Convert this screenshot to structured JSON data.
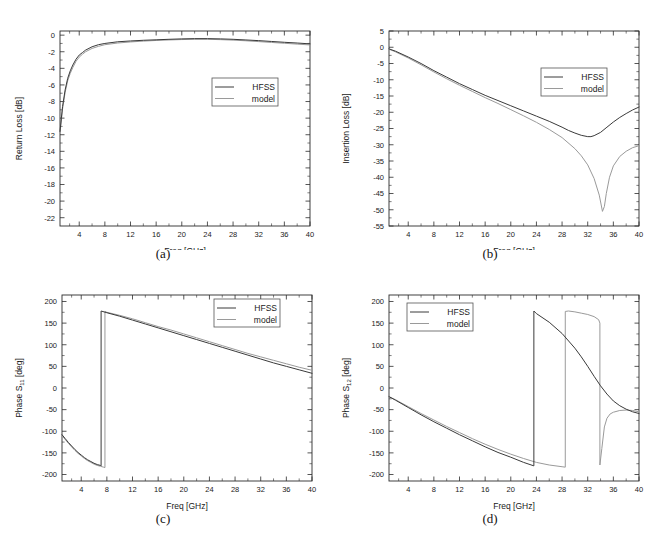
{
  "figure": {
    "panel_captions": [
      "(a)",
      "(b)",
      "(c)",
      "(d)"
    ],
    "legend_entries": [
      "HFSS",
      "model"
    ],
    "colors": {
      "hfss": "#3a3a3a",
      "model": "#9a9a9a",
      "axis": "#2b2b2b",
      "background": "#ffffff"
    }
  },
  "chart_data": [
    {
      "id": "a",
      "type": "line",
      "title": "",
      "caption": "(a)",
      "xlabel": "Freq [GHz]",
      "ylabel": "Return Loss [dB]",
      "xlim": [
        1,
        40
      ],
      "ylim": [
        -23,
        0.5
      ],
      "xticks": [
        4,
        8,
        12,
        16,
        20,
        24,
        28,
        32,
        36,
        40
      ],
      "yticks": [
        0,
        -2,
        -4,
        -6,
        -8,
        -10,
        -12,
        -14,
        -16,
        -18,
        -20,
        -22
      ],
      "grid": false,
      "legend": [
        "HFSS",
        "model"
      ],
      "legend_position": "center-right",
      "series": [
        {
          "name": "HFSS",
          "x": [
            1,
            1.4,
            1.8,
            2.2,
            2.6,
            3,
            3.5,
            4,
            4.5,
            5,
            6,
            7,
            8,
            10,
            12,
            14,
            16,
            18,
            20,
            22,
            24,
            26,
            28,
            30,
            32,
            34,
            36,
            38,
            40
          ],
          "y": [
            -11.6,
            -8.6,
            -6.6,
            -5.2,
            -4.3,
            -3.6,
            -2.9,
            -2.4,
            -2.1,
            -1.8,
            -1.4,
            -1.15,
            -1.0,
            -0.8,
            -0.7,
            -0.62,
            -0.56,
            -0.5,
            -0.45,
            -0.42,
            -0.42,
            -0.45,
            -0.5,
            -0.58,
            -0.66,
            -0.76,
            -0.86,
            -0.95,
            -1.05
          ]
        },
        {
          "name": "model",
          "x": [
            1,
            1.4,
            1.8,
            2.2,
            2.6,
            3,
            3.5,
            4,
            4.5,
            5,
            6,
            7,
            8,
            10,
            12,
            14,
            16,
            18,
            20,
            22,
            24,
            26,
            28,
            30,
            32,
            34,
            36,
            38,
            40
          ],
          "y": [
            -11.8,
            -8.9,
            -6.9,
            -5.5,
            -4.6,
            -3.9,
            -3.15,
            -2.65,
            -2.3,
            -2.0,
            -1.6,
            -1.35,
            -1.15,
            -0.95,
            -0.82,
            -0.72,
            -0.64,
            -0.58,
            -0.53,
            -0.5,
            -0.5,
            -0.54,
            -0.6,
            -0.68,
            -0.78,
            -0.88,
            -0.98,
            -1.08,
            -1.18
          ]
        }
      ]
    },
    {
      "id": "b",
      "type": "line",
      "title": "",
      "caption": "(b)",
      "xlabel": "Freq [GHz]",
      "ylabel": "Insertion Loss [dB]",
      "xlim": [
        1,
        40
      ],
      "ylim": [
        -55,
        5
      ],
      "xticks": [
        4,
        8,
        12,
        16,
        20,
        24,
        28,
        32,
        36,
        40
      ],
      "yticks": [
        5,
        0,
        -5,
        -10,
        -15,
        -20,
        -25,
        -30,
        -35,
        -40,
        -45,
        -50,
        -55
      ],
      "grid": false,
      "legend": [
        "HFSS",
        "model"
      ],
      "legend_position": "center-right",
      "series": [
        {
          "name": "HFSS",
          "x": [
            1,
            2,
            4,
            6,
            8,
            10,
            12,
            14,
            16,
            18,
            20,
            22,
            24,
            26,
            28,
            29,
            30,
            31,
            32,
            32.5,
            33,
            34,
            35,
            36,
            37,
            38,
            39,
            40
          ],
          "y": [
            -0.5,
            -1.2,
            -3.0,
            -5.0,
            -7.2,
            -9.2,
            -11.2,
            -13.0,
            -14.8,
            -16.4,
            -18.0,
            -19.6,
            -21.2,
            -22.8,
            -24.6,
            -25.6,
            -26.4,
            -27.1,
            -27.5,
            -27.5,
            -27.2,
            -26.2,
            -24.6,
            -23.0,
            -21.6,
            -20.4,
            -19.3,
            -18.4
          ]
        },
        {
          "name": "model",
          "x": [
            1,
            2,
            4,
            6,
            8,
            10,
            12,
            14,
            16,
            18,
            20,
            22,
            24,
            26,
            28,
            30,
            31,
            32,
            33,
            33.8,
            34.3,
            34.6,
            34.9,
            35.4,
            36,
            37,
            38,
            39,
            40
          ],
          "y": [
            -0.6,
            -1.4,
            -3.3,
            -5.4,
            -7.6,
            -9.7,
            -11.7,
            -13.6,
            -15.5,
            -17.3,
            -19.2,
            -21.1,
            -23.1,
            -25.3,
            -27.8,
            -31.2,
            -33.4,
            -36.2,
            -40.4,
            -45.5,
            -50.5,
            -49.0,
            -45.0,
            -40.0,
            -36.5,
            -33.6,
            -32.0,
            -30.9,
            -30.3
          ]
        }
      ]
    },
    {
      "id": "c",
      "type": "line",
      "title": "",
      "caption": "(c)",
      "xlabel": "Freq [GHz]",
      "ylabel": "Phase S11 [deg]",
      "ylabel_base": "Phase S",
      "ylabel_sub": "11",
      "ylabel_unit": " [deg]",
      "xlim": [
        1,
        40
      ],
      "ylim": [
        -215,
        215
      ],
      "xticks": [
        4,
        8,
        12,
        16,
        20,
        24,
        28,
        32,
        36,
        40
      ],
      "yticks": [
        200,
        150,
        100,
        50,
        0,
        -50,
        -100,
        -150,
        -200
      ],
      "grid": false,
      "legend": [
        "HFSS",
        "model"
      ],
      "legend_position": "top-right",
      "series": [
        {
          "name": "HFSS",
          "wrap_at": 7.1,
          "x": [
            1,
            1.5,
            2,
            2.5,
            3,
            3.5,
            4,
            4.5,
            5,
            5.5,
            6,
            6.5,
            7,
            7.1,
            7.1,
            8,
            10,
            12,
            14,
            16,
            18,
            20,
            22,
            24,
            26,
            28,
            30,
            32,
            34,
            36,
            38,
            40
          ],
          "y": [
            -108,
            -117,
            -126,
            -134,
            -142,
            -149,
            -155,
            -161,
            -166,
            -170,
            -174,
            -177,
            -179,
            -180,
            178,
            174,
            166,
            157,
            148,
            139,
            130,
            121,
            112,
            103,
            94,
            85,
            76,
            67,
            58,
            50,
            42,
            34
          ]
        },
        {
          "name": "model",
          "wrap_at": 7.7,
          "x": [
            1,
            1.5,
            2,
            2.5,
            3,
            3.5,
            4,
            4.5,
            5,
            5.5,
            6,
            6.5,
            7,
            7.5,
            7.7,
            7.7,
            8,
            10,
            12,
            14,
            16,
            18,
            20,
            22,
            24,
            26,
            28,
            30,
            32,
            34,
            36,
            38,
            40
          ],
          "y": [
            -110,
            -119,
            -128,
            -136,
            -144,
            -151,
            -157,
            -163,
            -168,
            -172,
            -176,
            -179,
            -181,
            -183,
            -184,
            177,
            175,
            168,
            160,
            151,
            142,
            134,
            125,
            116,
            107,
            98,
            89,
            80,
            72,
            64,
            56,
            48,
            41
          ]
        }
      ]
    },
    {
      "id": "d",
      "type": "line",
      "title": "",
      "caption": "(d)",
      "xlabel": "Freq [GHz]",
      "ylabel": "Phase S12 [deg]",
      "ylabel_base": "Phase S",
      "ylabel_sub": "12",
      "ylabel_unit": " [deg]",
      "xlim": [
        1,
        40
      ],
      "ylim": [
        -215,
        215
      ],
      "xticks": [
        4,
        8,
        12,
        16,
        20,
        24,
        28,
        32,
        36,
        40
      ],
      "yticks": [
        200,
        150,
        100,
        50,
        0,
        -50,
        -100,
        -150,
        -200
      ],
      "grid": false,
      "legend": [
        "HFSS",
        "model"
      ],
      "legend_position": "top-left",
      "series": [
        {
          "name": "HFSS",
          "wrap_at": 23.6,
          "x": [
            1,
            2,
            4,
            6,
            8,
            10,
            12,
            14,
            16,
            18,
            20,
            22,
            23.6,
            23.6,
            24,
            26,
            28,
            30,
            31,
            32,
            33,
            34,
            35,
            36,
            37,
            38,
            39,
            40
          ],
          "y": [
            -20,
            -28,
            -45,
            -62,
            -78,
            -93,
            -108,
            -122,
            -136,
            -149,
            -160,
            -172,
            -180,
            178,
            172,
            152,
            126,
            92,
            72,
            50,
            27,
            5,
            -14,
            -30,
            -41,
            -49,
            -55,
            -59
          ]
        },
        {
          "name": "model",
          "wrap_at": 28.5,
          "x": [
            1,
            2,
            4,
            6,
            8,
            10,
            12,
            14,
            16,
            18,
            20,
            22,
            24,
            26,
            28,
            28.5,
            28.5,
            29,
            30,
            31,
            32,
            33,
            33.7,
            33.9,
            33.9,
            34.2,
            34.6,
            35,
            35.5,
            36,
            37,
            38,
            39,
            40
          ],
          "y": [
            -20,
            -27,
            -43,
            -59,
            -74,
            -89,
            -103,
            -117,
            -130,
            -142,
            -153,
            -163,
            -172,
            -178,
            -182,
            -183,
            177,
            178,
            176,
            173,
            170,
            165,
            158,
            150,
            -178,
            -140,
            -90,
            -70,
            -60,
            -56,
            -52,
            -51,
            -52,
            -55
          ]
        }
      ]
    }
  ]
}
